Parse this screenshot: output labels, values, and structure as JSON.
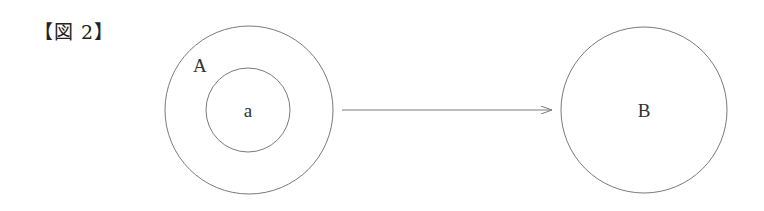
{
  "figure": {
    "label": "【図 2】"
  },
  "diagram": {
    "set_A": {
      "label": "A",
      "cx": 249,
      "cy": 110,
      "r": 84
    },
    "subset_a": {
      "label": "a",
      "cx": 248,
      "cy": 110,
      "r": 42
    },
    "set_B": {
      "label": "B",
      "cx": 644,
      "cy": 110,
      "r": 83
    },
    "arrow": {
      "from": "A",
      "to": "B",
      "x1": 342,
      "y1": 110,
      "x2": 552,
      "y2": 110
    },
    "colors": {
      "stroke": "#7a7a7a",
      "text": "#333333"
    }
  }
}
